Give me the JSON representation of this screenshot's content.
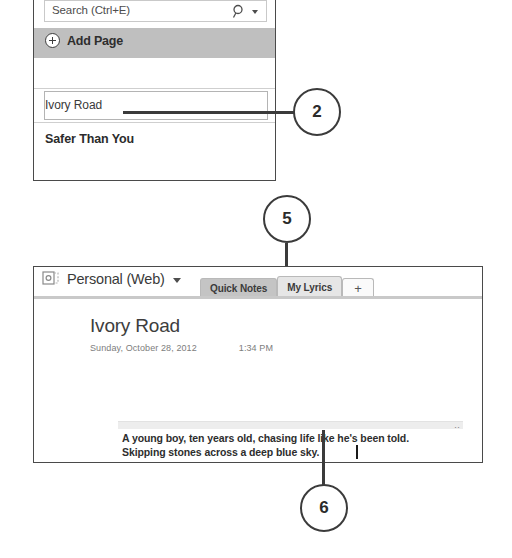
{
  "page_list_panel": {
    "search": {
      "placeholder": "Search (Ctrl+E)",
      "icon": "search-icon",
      "dropdown_icon": "chevron-down-icon"
    },
    "add_page": {
      "label": "Add Page",
      "icon": "plus-circle-icon"
    },
    "pages": [
      {
        "label": "Ivory Road",
        "selected": true
      },
      {
        "label": "Safer Than You",
        "selected": false
      }
    ]
  },
  "callouts": [
    {
      "number": "2"
    },
    {
      "number": "5"
    },
    {
      "number": "6"
    }
  ],
  "onenote_window": {
    "notebook": {
      "name": "Personal (Web)",
      "icon": "notebook-icon",
      "dropdown_icon": "chevron-down-icon"
    },
    "tabs": [
      {
        "label": "Quick Notes",
        "active": false
      },
      {
        "label": "My Lyrics",
        "active": true
      },
      {
        "label": "+",
        "active": false
      }
    ],
    "page": {
      "title": "Ivory Road",
      "date": "Sunday, October 28, 2012",
      "time": "1:34 PM",
      "resize_dots": "‥",
      "body_lines": [
        "A young boy, ten years old, chasing life like he's been told.",
        "Skipping stones across a deep blue sky."
      ]
    }
  },
  "colors": {
    "panel_border": "#4a4a4a",
    "add_page_band": "#bfbfbf",
    "tab_inactive": "#c4c4c4",
    "tab_active": "#e6e6e6",
    "callout_stroke": "#3b3b3b",
    "leader_line": "#3b3b3b",
    "meta_text": "#7d7d7d"
  }
}
